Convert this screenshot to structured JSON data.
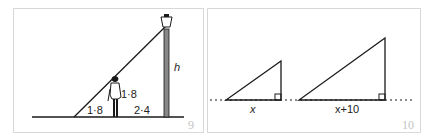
{
  "figures": [
    {
      "number": "9",
      "labels": {
        "shadow_length": "1·8",
        "person_height": "1·8",
        "distance_to_lamp": "2·4",
        "lamp_height": "h"
      },
      "elements": [
        "ground-line",
        "lamp-post",
        "lamp",
        "person",
        "light-ray"
      ]
    },
    {
      "number": "10",
      "labels": {
        "small_base": "x",
        "large_base": "x+10"
      },
      "elements": [
        "dotted-baseline",
        "small-right-triangle",
        "large-right-triangle",
        "right-angle-markers"
      ]
    }
  ],
  "colors": {
    "line": "#1a1a1a",
    "border": "#d8d8d8",
    "figure_number": "#c4c4c4"
  }
}
